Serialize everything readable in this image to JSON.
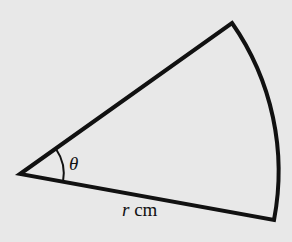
{
  "diagram": {
    "type": "circular-sector",
    "background_color": "#e8e8e8",
    "stroke_color": "#111111",
    "center": [
      20,
      174
    ],
    "arc_start": [
      274,
      220
    ],
    "arc_end": [
      232,
      23
    ],
    "radius_px": 259,
    "angle_label": "θ",
    "radius_label": {
      "variable": "r",
      "unit": "cm"
    }
  }
}
